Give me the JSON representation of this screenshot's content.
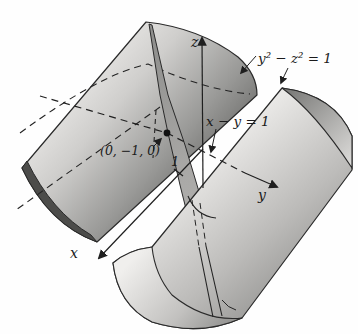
{
  "figure": {
    "type": "math-3d-diagram",
    "labels": {
      "z_axis": "z",
      "y_axis": "y",
      "x_axis": "x",
      "cylinder_equation": "y² − z² = 1",
      "plane_equation": "x − y = 1",
      "point": "(0, −1, 0)",
      "x_intercept_tick": "1"
    },
    "colors": {
      "ink": "#1f1f1f",
      "background": "#fefefe",
      "surface_light": "#f3f2f0",
      "surface_mid": "#b9b8b6",
      "surface_dark": "#6f6f6d",
      "plane_gray": "#a3a2a0"
    }
  }
}
